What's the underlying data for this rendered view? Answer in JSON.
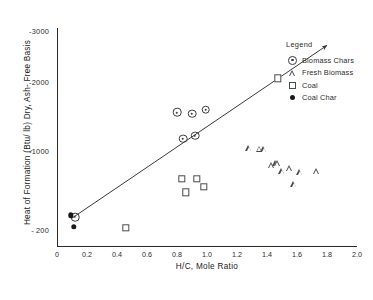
{
  "chart_data": {
    "type": "scatter",
    "title": "",
    "xlabel": "H/C, Mole Ratio",
    "ylabel": "Heat of Formation (Btu/ lb) Dry, Ash- Free Basis",
    "xlim": [
      0,
      2.0
    ],
    "xticks": [
      "0",
      "0.2",
      "0.4",
      "0.6",
      "0.8",
      "1.0",
      "1.2",
      "1.4",
      "1.6",
      "1.8",
      "2.0"
    ],
    "xtickvals": [
      0,
      0.2,
      0.4,
      0.6,
      0.8,
      1.0,
      1.2,
      1.4,
      1.6,
      1.8,
      2.0
    ],
    "yticks": [
      "- 200",
      "-1000",
      "-2000",
      "-3000"
    ],
    "ytickvals": [
      -200,
      -1000,
      -2000,
      -3000
    ],
    "grid": false,
    "legend_position": "right",
    "legend_title": "Legend",
    "series": [
      {
        "name": "Biomass Chars",
        "marker": "circle-dot",
        "points": [
          {
            "x": 0.12,
            "y": -310
          },
          {
            "x": 0.8,
            "y": -1530
          },
          {
            "x": 0.84,
            "y": -1150
          },
          {
            "x": 0.9,
            "y": -1510
          },
          {
            "x": 0.92,
            "y": -1190
          },
          {
            "x": 0.99,
            "y": -1570
          }
        ]
      },
      {
        "name": "Fresh Biomass",
        "marker": "triangle",
        "points": [
          {
            "x": 1.28,
            "y": -1880
          },
          {
            "x": 1.35,
            "y": -1960
          },
          {
            "x": 1.38,
            "y": -2060
          },
          {
            "x": 1.43,
            "y": -1900
          },
          {
            "x": 1.46,
            "y": -2010
          },
          {
            "x": 1.47,
            "y": -2140
          },
          {
            "x": 1.5,
            "y": -2090
          },
          {
            "x": 1.55,
            "y": -2260
          },
          {
            "x": 1.58,
            "y": -2070
          },
          {
            "x": 1.62,
            "y": -2420
          },
          {
            "x": 1.73,
            "y": -2560
          }
        ]
      },
      {
        "name": "Coal",
        "marker": "square",
        "points": [
          {
            "x": 0.46,
            "y": -200
          },
          {
            "x": 0.83,
            "y": -700
          },
          {
            "x": 0.86,
            "y": -560
          },
          {
            "x": 0.93,
            "y": -700
          },
          {
            "x": 0.98,
            "y": -620
          },
          {
            "x": 1.47,
            "y": -2030
          }
        ]
      },
      {
        "name": "Coal Char",
        "marker": "filled-circle",
        "points": [
          {
            "x": 0.09,
            "y": -330
          },
          {
            "x": 0.11,
            "y": -215
          }
        ]
      }
    ],
    "trendline": {
      "description": "straight fitted line with arrowhead at upper right",
      "x_start": 0.1,
      "y_start": -300,
      "x_end": 1.8,
      "y_end": -2680,
      "arrow": true
    }
  }
}
